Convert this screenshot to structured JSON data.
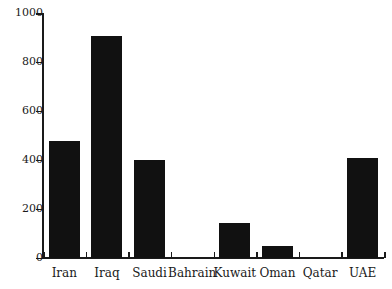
{
  "chart_data": {
    "type": "bar",
    "title": "",
    "subtitle": "",
    "xlabel": "",
    "ylabel": "",
    "categories": [
      "Iran",
      "Iraq",
      "Saudi",
      "Bahrain",
      "Kuwait",
      "Oman",
      "Qatar",
      "UAE"
    ],
    "values": [
      480,
      910,
      400,
      0,
      145,
      50,
      0,
      410
    ],
    "ylim": [
      0,
      1000
    ],
    "yticks": [
      0,
      200,
      400,
      600,
      800,
      1000
    ],
    "ytick_labels": [
      "0",
      "200",
      "400",
      "600",
      "800",
      "1000"
    ],
    "grid": false,
    "legend": null,
    "bar_color": "#111111",
    "axis_color": "#1a1a1a",
    "background_color": "#ffffff",
    "series": [
      {
        "name": "",
        "values": [
          480,
          910,
          400,
          0,
          145,
          50,
          0,
          410
        ]
      }
    ]
  }
}
